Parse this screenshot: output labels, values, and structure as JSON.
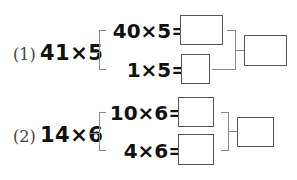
{
  "problems": [
    {
      "label": "(1)",
      "expression": "41×5",
      "split": [
        {
          "expr": "40×5="
        },
        {
          "expr": "1×5="
        }
      ]
    },
    {
      "label": "(2)",
      "expression": "14×6",
      "split": [
        {
          "expr": "10×6="
        },
        {
          "expr": "4×6="
        }
      ]
    }
  ]
}
